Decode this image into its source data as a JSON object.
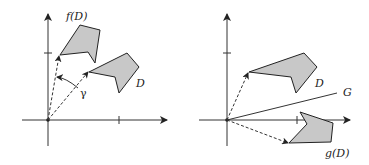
{
  "left_panel": {
    "labels": {
      "f_image": "f(D)",
      "domain": "D",
      "angle": "γ"
    },
    "origin": [
      48,
      120
    ],
    "domain_polygon": [
      [
        89,
        72
      ],
      [
        127,
        53
      ],
      [
        139,
        67
      ],
      [
        119,
        93
      ],
      [
        115,
        77
      ]
    ],
    "image_polygon": [
      [
        60,
        55
      ],
      [
        80,
        25
      ],
      [
        100,
        30
      ],
      [
        95,
        63
      ],
      [
        88,
        52
      ]
    ]
  },
  "right_panel": {
    "labels": {
      "domain": "D",
      "line": "G",
      "g_image": "g(D)"
    },
    "origin": [
      227,
      120
    ],
    "domain_polygon": [
      [
        249,
        72
      ],
      [
        304,
        53
      ],
      [
        317,
        67
      ],
      [
        296,
        93
      ],
      [
        291,
        77
      ]
    ],
    "image_polygon": [
      [
        289,
        143
      ],
      [
        307,
        124
      ],
      [
        300,
        112
      ],
      [
        333,
        123
      ],
      [
        331,
        142
      ]
    ]
  },
  "colors": {
    "fill": "#c8c8c8",
    "stroke": "#222222"
  }
}
